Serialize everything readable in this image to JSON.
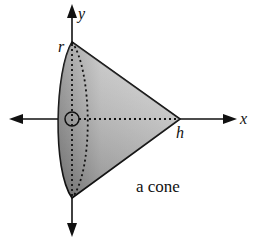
{
  "figure": {
    "caption": "a cone",
    "labels": {
      "y_axis": "y",
      "x_axis": "x",
      "radius": "r",
      "height": "h"
    },
    "colors": {
      "stroke": "#111111",
      "fill_light": "#d6d6d6",
      "fill_dark": "#8a8a8a",
      "background": "#ffffff"
    }
  }
}
